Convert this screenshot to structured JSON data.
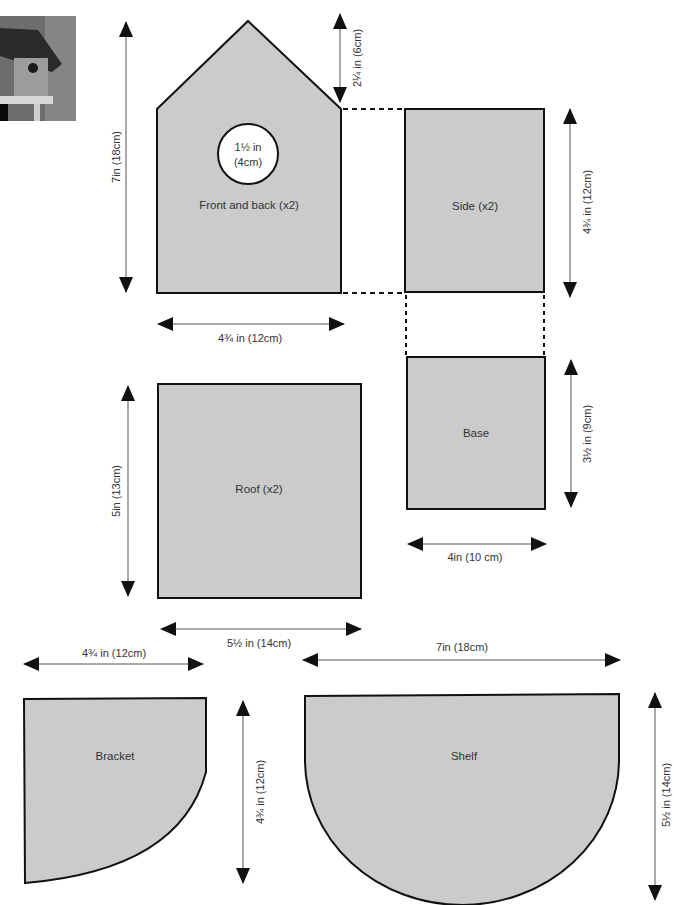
{
  "diagram": {
    "type": "bird-box cutting template",
    "colors": {
      "piece_fill": "#cbcbcb",
      "outline": "#111111",
      "dim_line": "#555555",
      "arrowhead": "#111111",
      "text": "#333333"
    },
    "photo": {
      "alt": "bird house photo"
    },
    "pieces": {
      "front_back": {
        "label": "Front and back (x2)",
        "hole_label_line1": "1½ in",
        "hole_label_line2": "(4cm)",
        "height_dim": "7in (18cm)",
        "gable_dim": "2¼ in (6cm)",
        "width_dim": "4¾ in (12cm)"
      },
      "side": {
        "label": "Side (x2)",
        "height_dim": "4¾ in (12cm)"
      },
      "base": {
        "label": "Base",
        "height_dim": "3½ in (9cm)",
        "width_dim": "4in (10 cm)"
      },
      "roof": {
        "label": "Roof (x2)",
        "height_dim": "5in (13cm)",
        "width_dim": "5½ in (14cm)"
      },
      "bracket": {
        "label": "Bracket",
        "width_dim": "4¾ in (12cm)",
        "height_dim": "4¾ in (12cm)"
      },
      "shelf": {
        "label": "Shelf",
        "width_dim": "7in (18cm)",
        "height_dim": "5½ in (14cm)"
      }
    }
  }
}
